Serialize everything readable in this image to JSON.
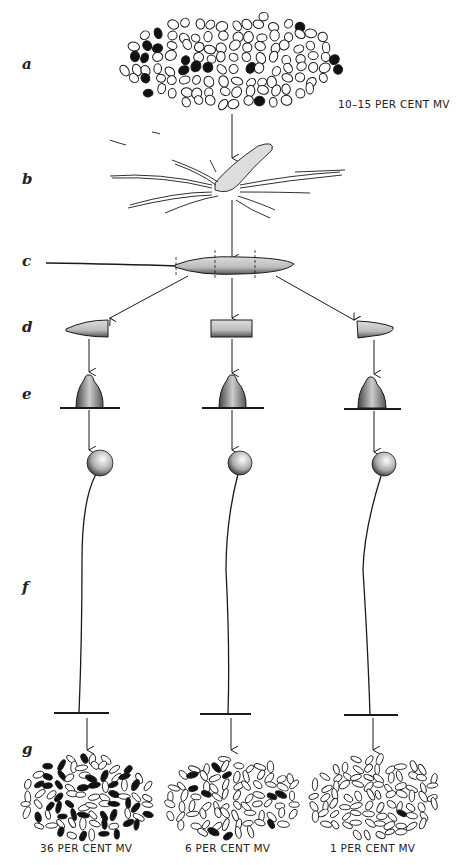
{
  "figure": {
    "row_labels": [
      "a",
      "b",
      "c",
      "d",
      "e",
      "f",
      "g"
    ],
    "top_caption": "10–15 PER CENT MV",
    "bottom_captions": [
      "36 PER CENT MV",
      "6 PER CENT MV",
      "1 PER CENT MV"
    ],
    "stages": {
      "a": "cell population with dark (MV) cells scattered",
      "b": "migrating aggregate with streams",
      "c": "slug with trail, divided by dashed lines into three parts",
      "d": "three slug fragments: anterior, middle, posterior",
      "e": "culminating mounds",
      "f": "fruiting bodies (sorocarps) on stalks",
      "g": "resulting spore populations"
    },
    "colors": {
      "ink": "#1a1a1a",
      "paper": "#ffffff"
    }
  }
}
